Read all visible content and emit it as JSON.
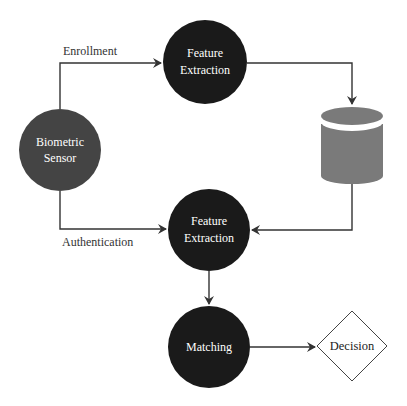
{
  "diagram": {
    "colors": {
      "node_dark": "#1a1a1a",
      "node_sensor": "#444444",
      "database": "#7a7a7a",
      "edge": "#333333",
      "decision_stroke": "#444444",
      "background": "#ffffff"
    },
    "nodes": {
      "sensor": {
        "line1": "Biometric",
        "line2": "Sensor"
      },
      "feature_enroll": {
        "line1": "Feature",
        "line2": "Extraction"
      },
      "database": {
        "icon": "database-cylinder-icon"
      },
      "feature_auth": {
        "line1": "Feature",
        "line2": "Extraction"
      },
      "matching": {
        "label": "Matching"
      },
      "decision": {
        "label": "Decision"
      }
    },
    "edges": {
      "enrollment": {
        "label": "Enrollment"
      },
      "authentication": {
        "label": "Authentication"
      }
    }
  }
}
